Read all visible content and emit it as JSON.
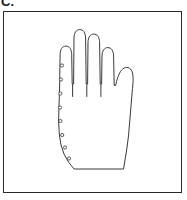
{
  "figure": {
    "label": "C.",
    "caption": "",
    "background_color": "#ffffff",
    "stroke_color": "#2b2b2b",
    "frame": {
      "name": "figure-border",
      "x": 3,
      "y": 11,
      "width": 179,
      "height": 182,
      "stroke_color": "#2b2b2b",
      "stroke_width": 1,
      "fill": "#ffffff"
    }
  },
  "diagram": {
    "stroke_color": "#3a3a3a",
    "stroke_width": 1,
    "fill": "#ffffff",
    "bounds": {
      "x": 57,
      "y": 31,
      "width": 78,
      "height": 139
    },
    "outline_path": "M 74.5 169 L 123.5 169 L 126.5 151 L 128.5 136 L 130 118 L 131.5 100 L 132.5 88.5 C 133.5 79 133.5 72 130.5 69 C 127.5 66 123 67.5 120.5 71.5 C 118.5 74.8 116.8 79.5 115.6 85.5 L 114.2 85.5 L 113.6 56 C 113.5 50.5 111.2 47.6 107.8 47.6 C 104.4 47.6 102.1 50.5 102 56 L 101.6 84 L 100.2 84 L 99.6 42.5 C 99.5 37 97.2 34.1 93.8 34.1 C 90.4 34.1 88.1 37 88 42.5 L 87.6 84 L 86.2 84 L 85.6 38 C 85.5 32.5 83.2 29.6 79.8 29.6 C 76.4 29.6 74.1 32.5 74 38 L 73.6 84 L 72.2 84 L 71.7 54.5 C 71.6 49 69.3 46.1 65.9 46.1 C 62.5 46.1 60.2 49 60.1 54.5 L 59.6 88 L 59 106 L 58.6 122 L 59.4 135 L 61 145 L 64 154 L 68.5 162 Z",
    "finger_lines": [
      {
        "name": "finger-gap-line-1",
        "x1": 72.6,
        "y1": 84.5,
        "x2": 72.6,
        "y2": 96.5
      },
      {
        "name": "finger-gap-line-2",
        "x1": 86.8,
        "y1": 84.5,
        "x2": 86.8,
        "y2": 96.5
      },
      {
        "name": "finger-gap-line-3",
        "x1": 100.9,
        "y1": 84.5,
        "x2": 100.9,
        "y2": 96.5
      }
    ],
    "marker_dots": {
      "name": "edge-marker-dots",
      "count": 8,
      "shape": "circle",
      "radius": 1.6,
      "fill": "#ffffff",
      "stroke_color": "#4a4a4a",
      "stroke_width": 0.9,
      "points": [
        {
          "index": 1,
          "cx": 62.0,
          "cy": 65.5
        },
        {
          "index": 2,
          "cx": 61.0,
          "cy": 79.5
        },
        {
          "index": 3,
          "cx": 60.3,
          "cy": 93.5
        },
        {
          "index": 4,
          "cx": 60.0,
          "cy": 107.5
        },
        {
          "index": 5,
          "cx": 60.4,
          "cy": 121.0
        },
        {
          "index": 6,
          "cx": 62.2,
          "cy": 135.0
        },
        {
          "index": 7,
          "cx": 65.0,
          "cy": 147.5
        },
        {
          "index": 8,
          "cx": 69.0,
          "cy": 158.5
        }
      ]
    }
  }
}
